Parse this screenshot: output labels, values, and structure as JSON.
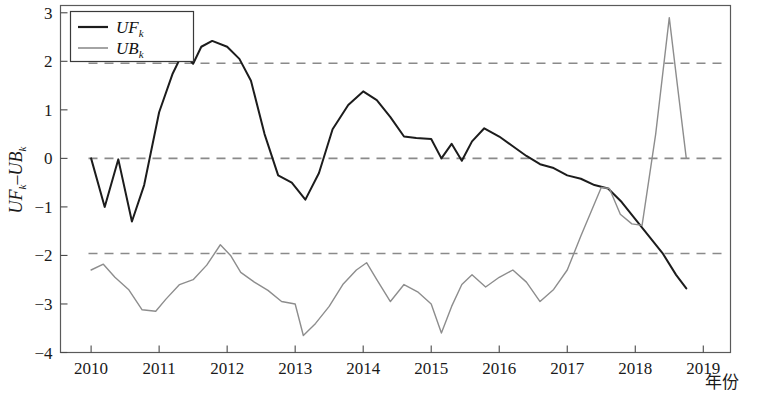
{
  "chart_data": {
    "type": "line",
    "title": "",
    "xlabel": "年份",
    "ylabel": "UF_k - UB_k",
    "ylabel_parts": {
      "uf": "UF",
      "uf_sub": "k",
      "minus": "–",
      "ub": "UB",
      "ub_sub": "k"
    },
    "xlim": [
      2009.55,
      2019.4
    ],
    "ylim": [
      -4,
      3.15
    ],
    "xticks": [
      2010,
      2011,
      2012,
      2013,
      2014,
      2015,
      2016,
      2017,
      2018,
      2019
    ],
    "xtick_labels": [
      "2010",
      "2011",
      "2012",
      "2013",
      "2014",
      "2015",
      "2016",
      "2017",
      "2018",
      "2019"
    ],
    "yticks": [
      -4,
      -3,
      -2,
      -1,
      0,
      1,
      2,
      3
    ],
    "ytick_labels": [
      "−4",
      "−3",
      "−2",
      "−1",
      "0",
      "1",
      "2",
      "3"
    ],
    "grid": false,
    "legend_position": "top-left",
    "reference_lines": [
      {
        "name": "upper-confidence-line",
        "value": 1.96,
        "style": "dashed",
        "color": "#8a8a8a"
      },
      {
        "name": "zero-line",
        "value": 0.0,
        "style": "dashed",
        "color": "#8a8a8a"
      },
      {
        "name": "lower-confidence-line",
        "value": -1.96,
        "style": "dashed",
        "color": "#8a8a8a"
      }
    ],
    "series": [
      {
        "name": "UF_k",
        "label": "UF",
        "label_sub": "k",
        "color": "#1c1c1c",
        "width": 2.0,
        "x": [
          2010.0,
          2010.2,
          2010.4,
          2010.6,
          2010.78,
          2011.0,
          2011.2,
          2011.35,
          2011.5,
          2011.62,
          2011.78,
          2012.0,
          2012.18,
          2012.35,
          2012.55,
          2012.75,
          2012.95,
          2013.15,
          2013.35,
          2013.55,
          2013.78,
          2014.0,
          2014.2,
          2014.4,
          2014.6,
          2014.78,
          2015.0,
          2015.15,
          2015.3,
          2015.45,
          2015.6,
          2015.78,
          2016.0,
          2016.2,
          2016.4,
          2016.6,
          2016.8,
          2017.0,
          2017.2,
          2017.4,
          2017.6,
          2017.8,
          2018.0,
          2018.2,
          2018.4,
          2018.6,
          2018.75
        ],
        "y": [
          0.0,
          -1.0,
          -0.02,
          -1.3,
          -0.55,
          0.95,
          1.75,
          2.18,
          1.95,
          2.3,
          2.42,
          2.3,
          2.05,
          1.6,
          0.5,
          -0.35,
          -0.5,
          -0.85,
          -0.3,
          0.6,
          1.1,
          1.38,
          1.2,
          0.85,
          0.45,
          0.42,
          0.4,
          0.0,
          0.3,
          -0.05,
          0.35,
          0.62,
          0.45,
          0.25,
          0.05,
          -0.12,
          -0.2,
          -0.35,
          -0.42,
          -0.55,
          -0.62,
          -0.9,
          -1.25,
          -1.6,
          -1.95,
          -2.4,
          -2.68
        ]
      },
      {
        "name": "UB_k",
        "label": "UB",
        "label_sub": "k",
        "color": "#8d8d8d",
        "width": 1.4,
        "x": [
          2010.0,
          2010.18,
          2010.35,
          2010.55,
          2010.75,
          2010.95,
          2011.1,
          2011.3,
          2011.5,
          2011.7,
          2011.9,
          2012.05,
          2012.2,
          2012.4,
          2012.6,
          2012.8,
          2013.0,
          2013.12,
          2013.3,
          2013.5,
          2013.7,
          2013.9,
          2014.05,
          2014.2,
          2014.4,
          2014.6,
          2014.8,
          2015.0,
          2015.15,
          2015.3,
          2015.45,
          2015.6,
          2015.8,
          2016.0,
          2016.2,
          2016.4,
          2016.6,
          2016.8,
          2017.0,
          2017.2,
          2017.35,
          2017.5,
          2017.62,
          2017.78,
          2017.95,
          2018.1,
          2018.3,
          2018.5,
          2018.62,
          2018.75
        ],
        "y": [
          -2.3,
          -2.18,
          -2.45,
          -2.7,
          -3.12,
          -3.15,
          -2.9,
          -2.6,
          -2.5,
          -2.2,
          -1.78,
          -2.0,
          -2.35,
          -2.55,
          -2.72,
          -2.95,
          -3.0,
          -3.65,
          -3.4,
          -3.05,
          -2.6,
          -2.3,
          -2.15,
          -2.5,
          -2.95,
          -2.6,
          -2.75,
          -3.0,
          -3.6,
          -3.05,
          -2.6,
          -2.4,
          -2.65,
          -2.45,
          -2.3,
          -2.55,
          -2.95,
          -2.7,
          -2.3,
          -1.6,
          -1.1,
          -0.6,
          -0.62,
          -1.15,
          -1.35,
          -1.38,
          0.5,
          2.9,
          1.5,
          0.0
        ]
      }
    ]
  },
  "legend": {
    "entries": [
      {
        "label": "UF",
        "sub": "k",
        "color": "#1c1c1c"
      },
      {
        "label": "UB",
        "sub": "k",
        "color": "#8d8d8d"
      }
    ]
  },
  "caption": {
    "text": ""
  }
}
